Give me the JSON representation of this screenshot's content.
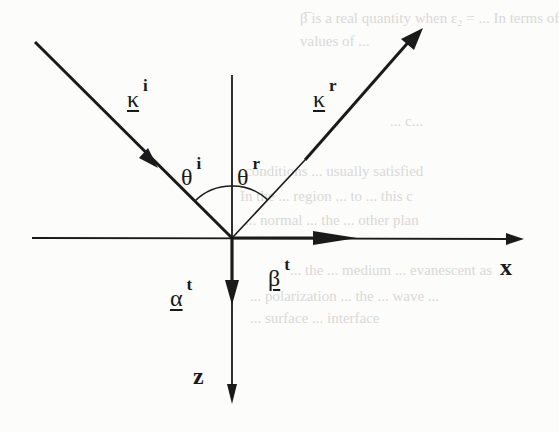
{
  "figure": {
    "type": "diagram",
    "colors": {
      "ink": "#1a1a1a",
      "background": "#fcfcfb",
      "bleed_text": "#d9d9d7"
    }
  },
  "axes": {
    "x": {
      "label": "x"
    },
    "z": {
      "label": "z"
    }
  },
  "vectors": {
    "incident": {
      "symbol": "κ",
      "superscript": "i",
      "underlined": true
    },
    "reflected": {
      "symbol": "κ",
      "superscript": "r",
      "underlined": true
    },
    "alpha_t": {
      "symbol": "α",
      "superscript": "t",
      "underlined": true
    },
    "beta_t": {
      "symbol": "β",
      "superscript": "t",
      "underlined": true
    }
  },
  "angles": {
    "incident": {
      "symbol": "θ",
      "superscript": "i"
    },
    "reflected": {
      "symbol": "θ",
      "superscript": "r"
    }
  },
  "bleed_through": [
    "β̅ is a real quantity when ε₂ = ... In terms of",
    "values of ...",
    "... c...",
    "conditions ... usually satisfied",
    "In the ... region ... to ... this c",
    "... normal ... the ... other plan",
    "... the ... medium ... evanescent as",
    "... polarization ... the ... wave ...",
    "... surface ... interface"
  ]
}
